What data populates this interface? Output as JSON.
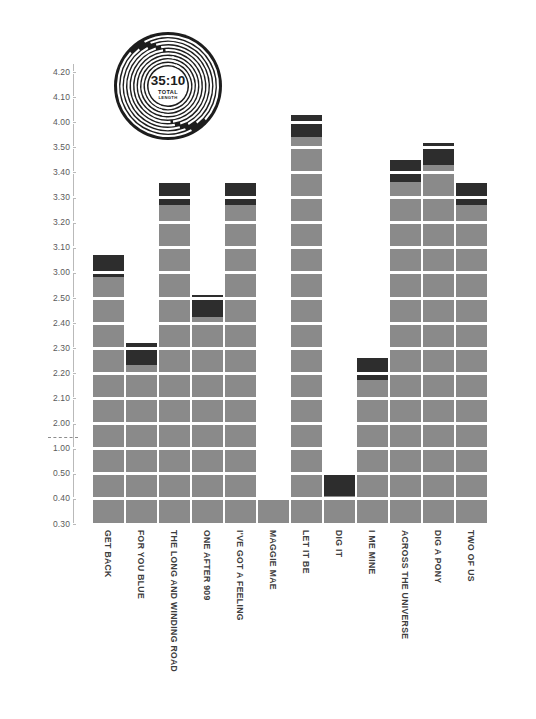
{
  "chart_data": {
    "type": "bar",
    "title": "",
    "subtitle": "",
    "xlabel": "",
    "ylabel": "",
    "categories": [
      "GET BACK",
      "FOR YOU BLUE",
      "THE LONG AND WINDING ROAD",
      "ONE AFTER 909",
      "I'VE GOT A FEELING",
      "MAGGIE MAE",
      "LET IT BE",
      "DIG IT",
      "I ME MINE",
      "ACROSS THE UNIVERSE",
      "DIG A PONY",
      "TWO OF US"
    ],
    "values": [
      3.07,
      2.32,
      3.36,
      2.56,
      3.36,
      0.4,
      4.03,
      0.5,
      2.26,
      3.45,
      3.58,
      3.36
    ],
    "ytick_labels": [
      "4.20",
      "4.10",
      "4.00",
      "3.50",
      "3.40",
      "3.30",
      "3.20",
      "3.10",
      "3.00",
      "2.50",
      "2.40",
      "2.30",
      "2.20",
      "2.10",
      "2.00",
      "1.00",
      "0.50",
      "0.40",
      "0.30"
    ],
    "ytick_values": [
      4.2,
      4.1,
      4.0,
      3.5,
      3.4,
      3.3,
      3.2,
      3.1,
      3.0,
      2.5,
      2.4,
      2.3,
      2.2,
      2.1,
      2.0,
      1.0,
      0.5,
      0.4,
      0.3
    ],
    "ylim": [
      0.3,
      4.2
    ],
    "axis_break_after": "2.00",
    "grid": true,
    "legend": "none",
    "units": "minutes:seconds (track length)",
    "series": [
      {
        "name": "Track length",
        "color": "#8a8a8a"
      },
      {
        "name": "Final segment",
        "color": "#2d2d2d"
      }
    ]
  },
  "record": {
    "total_time": "35:10",
    "label_line1": "TOTAL",
    "label_line2": "LENGTH",
    "color": "#1d1d1d"
  },
  "colors": {
    "bar": "#8a8a8a",
    "cap": "#2d2d2d",
    "axis": "#b9b9b9",
    "tick_text": "#5a5a5a",
    "label_text": "#3d3d3d",
    "background": "#ffffff"
  }
}
